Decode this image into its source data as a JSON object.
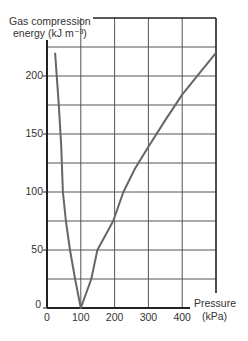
{
  "chart_data": {
    "type": "line",
    "title": "",
    "ylabel": "Gas compression energy (kJ m⁻³)",
    "xlabel": "Pressure (kPa)",
    "ylabel_line1": "Gas compression",
    "ylabel_line2": "energy (kJ m⁻³)",
    "xlabel_line1": "Pressure",
    "xlabel_line2": "(kPa)",
    "xlim": [
      0,
      500
    ],
    "ylim": [
      0,
      250
    ],
    "x_ticks": [
      0,
      100,
      200,
      300,
      400
    ],
    "x_tick_labels": [
      "0",
      "100",
      "200",
      "300",
      "400"
    ],
    "y_ticks": [
      0,
      50,
      100,
      150,
      200
    ],
    "y_tick_labels": [
      "0",
      "50",
      "100",
      "150",
      "200"
    ],
    "x_grid_step": 100,
    "y_grid_step": 25,
    "grid": true,
    "legend": null,
    "series": [
      {
        "name": "Gas compression energy",
        "color": "#666666",
        "points": [
          [
            24,
            220
          ],
          [
            35,
            175
          ],
          [
            42,
            140
          ],
          [
            47,
            100
          ],
          [
            56,
            75
          ],
          [
            68,
            50
          ],
          [
            83,
            25
          ],
          [
            100,
            0
          ],
          [
            131,
            25
          ],
          [
            149,
            50
          ],
          [
            196,
            75
          ],
          [
            226,
            100
          ],
          [
            260,
            120
          ],
          [
            300,
            139
          ],
          [
            350,
            162
          ],
          [
            400,
            184
          ],
          [
            450,
            202
          ],
          [
            500,
            220
          ]
        ]
      }
    ]
  }
}
